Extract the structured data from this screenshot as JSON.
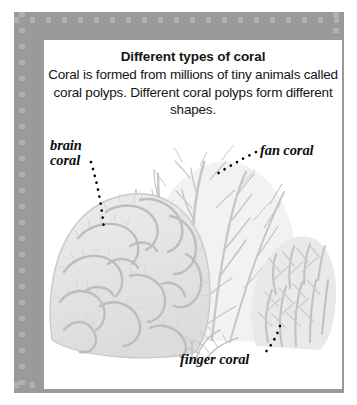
{
  "figure": {
    "title": "Different types of coral",
    "body": "Coral is formed from millions of tiny animals called coral polyps. Different coral polyps form different shapes.",
    "labels": {
      "brain": "brain\ncoral",
      "fan": "fan coral",
      "finger": "finger coral"
    },
    "colors": {
      "frame": "#9a9a9a",
      "frame_dot": "#b0b0b0",
      "panel": "#ffffff",
      "text": "#151515",
      "coral_light": "#e6e6e6",
      "coral_mid": "#cfcfcf",
      "coral_line": "#b8b8b8",
      "leader_dot": "#000000"
    }
  }
}
